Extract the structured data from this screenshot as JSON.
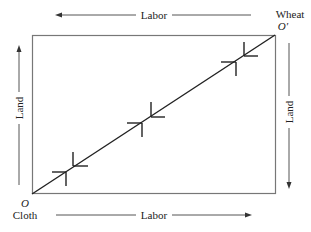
{
  "figure": {
    "top_axis": {
      "label": "Labor",
      "direction": "left"
    },
    "bottom_axis": {
      "label": "Labor",
      "direction": "right"
    },
    "left_axis": {
      "label": "Land",
      "direction": "up"
    },
    "right_axis": {
      "label": "Land",
      "direction": "down"
    },
    "origin_bottom_left": {
      "symbol": "O",
      "good": "Cloth"
    },
    "origin_top_right": {
      "symbol": "O′",
      "good": "Wheat"
    },
    "contract_curve": "diagonal",
    "markers_count": 3,
    "colors": {
      "line": "#222222",
      "frame": "#777777",
      "arrow": "#555555"
    }
  }
}
